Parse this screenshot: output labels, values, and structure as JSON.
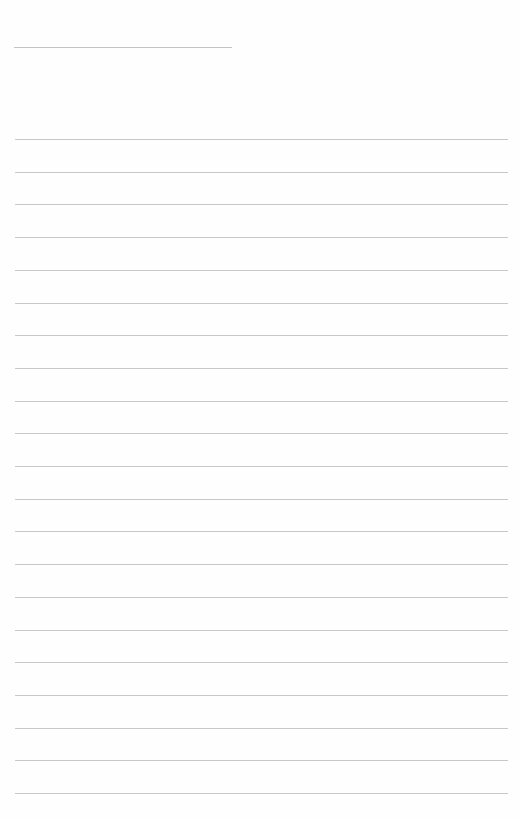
{
  "page": {
    "type": "ruled-notebook-page",
    "background_color": "#fefefe",
    "line_color": "#c8c8c8",
    "title_line": {
      "present": true,
      "text": ""
    },
    "ruled_lines": {
      "count": 21,
      "first_y": 139,
      "spacing": 32.7
    },
    "content": ""
  }
}
